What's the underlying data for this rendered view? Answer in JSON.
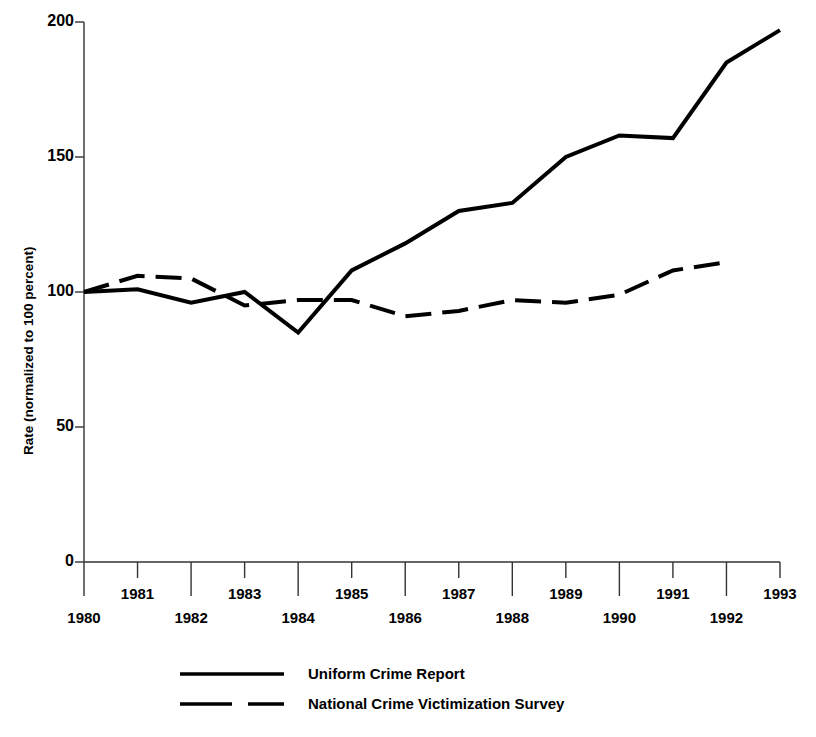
{
  "chart_data": {
    "type": "line",
    "title": "",
    "xlabel": "",
    "ylabel": "Rate (normalized to 100 percent)",
    "x": [
      1980,
      1981,
      1982,
      1983,
      1984,
      1985,
      1986,
      1987,
      1988,
      1989,
      1990,
      1991,
      1992,
      1993
    ],
    "xlim": [
      1980,
      1993
    ],
    "ylim": [
      0,
      200
    ],
    "yticks": [
      0,
      50,
      100,
      150,
      200
    ],
    "ytick_labels": [
      "0",
      "50",
      "100",
      "150",
      "200"
    ],
    "xticks": [
      1980,
      1981,
      1982,
      1983,
      1984,
      1985,
      1986,
      1987,
      1988,
      1989,
      1990,
      1991,
      1992,
      1993
    ],
    "xtick_labels": [
      "1980",
      "1981",
      "1982",
      "1983",
      "1984",
      "1985",
      "1986",
      "1987",
      "1988",
      "1989",
      "1990",
      "1991",
      "1992",
      "1993"
    ],
    "xtick_labels_lower_row": [
      "1980",
      "1982",
      "1984",
      "1986",
      "1988",
      "1990",
      "1992"
    ],
    "xtick_labels_upper_row": [
      "1981",
      "1983",
      "1985",
      "1987",
      "1989",
      "1991",
      "1993"
    ],
    "grid": false,
    "legend_position": "bottom-center",
    "series": [
      {
        "name": "Uniform Crime Report",
        "style": "solid",
        "color": "#000000",
        "x": [
          1980,
          1981,
          1982,
          1983,
          1984,
          1985,
          1986,
          1987,
          1988,
          1989,
          1990,
          1991,
          1992,
          1993
        ],
        "values": [
          100,
          101,
          96,
          100,
          85,
          108,
          118,
          130,
          133,
          150,
          158,
          157,
          185,
          197
        ]
      },
      {
        "name": "National Crime Victimization Survey",
        "style": "dashed",
        "color": "#000000",
        "x": [
          1980,
          1981,
          1982,
          1983,
          1984,
          1985,
          1986,
          1987,
          1988,
          1989,
          1990,
          1991,
          1992
        ],
        "values": [
          100,
          106,
          105,
          95,
          97,
          97,
          91,
          93,
          97,
          96,
          99,
          108,
          111
        ]
      }
    ]
  },
  "legend": {
    "items": [
      {
        "label": "Uniform Crime Report",
        "style": "solid"
      },
      {
        "label": "National Crime Victimization Survey",
        "style": "dashed"
      }
    ]
  },
  "axes": {
    "y_title": "Rate (normalized to 100 percent)"
  }
}
